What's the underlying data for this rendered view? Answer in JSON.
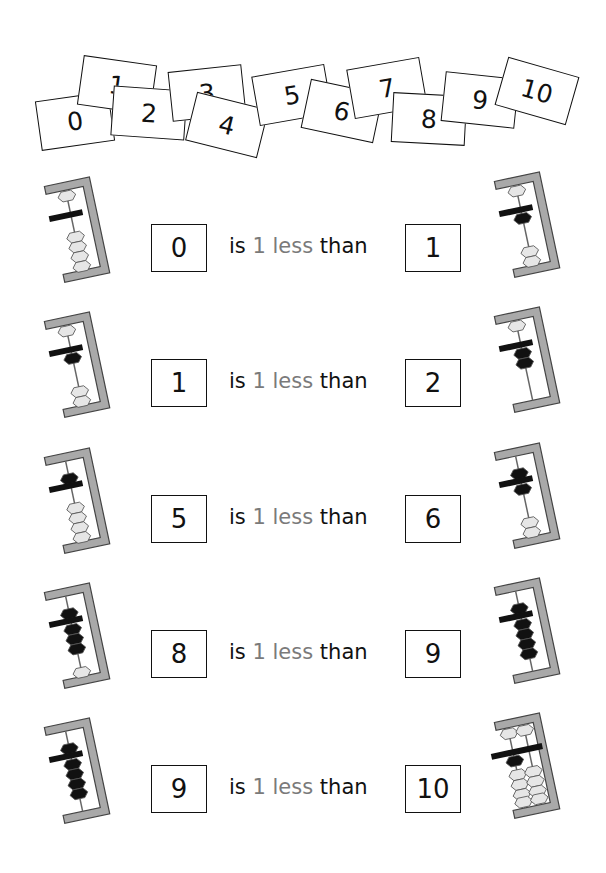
{
  "number_cards": [
    {
      "label": "0",
      "x": 38,
      "y": 96,
      "rot": -8
    },
    {
      "label": "1",
      "x": 80,
      "y": 60,
      "rot": 8
    },
    {
      "label": "2",
      "x": 112,
      "y": 88,
      "rot": 4
    },
    {
      "label": "3",
      "x": 170,
      "y": 68,
      "rot": -6
    },
    {
      "label": "4",
      "x": 190,
      "y": 100,
      "rot": 14
    },
    {
      "label": "5",
      "x": 255,
      "y": 70,
      "rot": -10
    },
    {
      "label": "6",
      "x": 305,
      "y": 86,
      "rot": 12
    },
    {
      "label": "7",
      "x": 350,
      "y": 63,
      "rot": -10
    },
    {
      "label": "8",
      "x": 392,
      "y": 94,
      "rot": 3
    },
    {
      "label": "9",
      "x": 443,
      "y": 75,
      "rot": 6
    },
    {
      "label": "10",
      "x": 500,
      "y": 66,
      "rot": 16
    }
  ],
  "rows": [
    {
      "left": "0",
      "right": "1",
      "y": 224,
      "left_abacus": {
        "top": 1,
        "bottom": 4,
        "dark_top": 0,
        "dark_bottom": 0
      },
      "right_abacus": {
        "top": 1,
        "bottom": 3,
        "dark_top": 0,
        "dark_bottom": 1
      }
    },
    {
      "left": "1",
      "right": "2",
      "y": 359,
      "left_abacus": {
        "top": 1,
        "bottom": 3,
        "dark_top": 0,
        "dark_bottom": 1
      },
      "right_abacus": {
        "top": 1,
        "bottom": 2,
        "dark_top": 0,
        "dark_bottom": 2
      }
    },
    {
      "left": "5",
      "right": "6",
      "y": 495,
      "left_abacus": {
        "top": 1,
        "bottom": 4,
        "dark_top": 1,
        "dark_bottom": 0
      },
      "right_abacus": {
        "top": 1,
        "bottom": 3,
        "dark_top": 1,
        "dark_bottom": 1
      }
    },
    {
      "left": "8",
      "right": "9",
      "y": 630,
      "left_abacus": {
        "top": 1,
        "bottom": 4,
        "dark_top": 1,
        "dark_bottom": 3
      },
      "right_abacus": {
        "top": 1,
        "bottom": 4,
        "dark_top": 1,
        "dark_bottom": 4
      }
    },
    {
      "left": "9",
      "right": "10",
      "y": 765,
      "left_abacus": {
        "top": 1,
        "bottom": 4,
        "dark_top": 1,
        "dark_bottom": 4
      },
      "right_abacus": {
        "columns": 2,
        "tens_value": 1,
        "ones_value": 0
      }
    }
  ],
  "phrase": {
    "is": "is",
    "amount": "1 less",
    "than": "than"
  },
  "colors": {
    "frame": "#a9a9a9",
    "frame_stroke": "#444444",
    "bead_light": "#e6e6e6",
    "bead_dark": "#111111",
    "gray_text": "#7a7a7a"
  }
}
